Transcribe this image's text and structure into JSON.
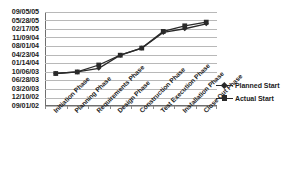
{
  "chart_data": {
    "type": "line",
    "title": "",
    "xlabel": "",
    "ylabel": "",
    "grid": true,
    "legend_position": "right",
    "categories": [
      "Initiation Phase",
      "Planning Phase",
      "Requirements Phase",
      "Design Phase",
      "Construction Phase",
      "Test Execution Phase",
      "Installation Phase",
      "Close Out Phase"
    ],
    "y_tick_labels": [
      "09/05/05",
      "05/28/05",
      "02/17/05",
      "11/09/04",
      "08/01/04",
      "04/23/04",
      "01/14/04",
      "10/06/03",
      "06/28/03",
      "03/20/03",
      "12/10/02",
      "09/01/02"
    ],
    "ylim": [
      "09/01/02",
      "09/05/05"
    ],
    "series": [
      {
        "name": "Planned Start",
        "marker": "diamond",
        "color": "#2a2a2a",
        "values": [
          "09/20/03",
          "10/08/03",
          "11/20/03",
          "04/20/04",
          "07/12/04",
          "01/10/05",
          "02/22/05",
          "04/20/05"
        ]
      },
      {
        "name": "Actual Start",
        "marker": "square",
        "color": "#2a2a2a",
        "values": [
          "09/20/03",
          "10/08/03",
          "12/28/03",
          "04/20/04",
          "07/12/04",
          "01/22/05",
          "03/28/05",
          "05/10/05"
        ]
      }
    ]
  },
  "legend": {
    "items": [
      {
        "label": "Planned Start"
      },
      {
        "label": "Actual Start"
      }
    ]
  }
}
